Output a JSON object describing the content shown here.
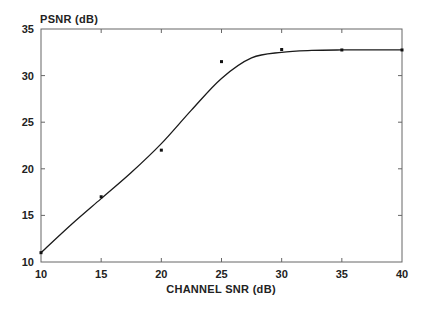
{
  "chart_data": {
    "type": "line",
    "title": "",
    "xlabel": "CHANNEL SNR (dB)",
    "ylabel": "PSNR (dB)",
    "xlim": [
      10,
      40
    ],
    "ylim": [
      10,
      35
    ],
    "xticks": [
      10,
      15,
      20,
      25,
      30,
      35,
      40
    ],
    "yticks": [
      10,
      15,
      20,
      25,
      30,
      35
    ],
    "grid": false,
    "legend": null,
    "series": [
      {
        "name": "measured",
        "style": "markers",
        "x": [
          10,
          15,
          20,
          25,
          30,
          35,
          40
        ],
        "y": [
          11.0,
          17.0,
          22.0,
          31.5,
          32.8,
          32.75,
          32.75
        ]
      },
      {
        "name": "fitted curve",
        "style": "line",
        "x": [
          10,
          12.5,
          15,
          17.5,
          20,
          22.5,
          25,
          27.5,
          30,
          32.5,
          35,
          37.5,
          40
        ],
        "y": [
          11.0,
          14.0,
          16.8,
          19.6,
          22.7,
          26.3,
          29.7,
          31.9,
          32.5,
          32.7,
          32.75,
          32.75,
          32.75
        ]
      }
    ]
  },
  "colors": {
    "line": "#1a1a1a",
    "axis": "#555555",
    "text": "#222222"
  }
}
